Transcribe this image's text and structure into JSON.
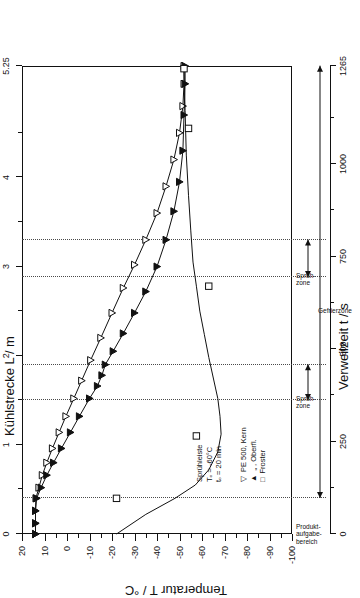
{
  "chart_data": {
    "type": "line",
    "title": "",
    "xlabel": "Temperatur T / °C",
    "ylabel": "Kühlstrecke L / m",
    "y2label": "Verweilzeit t / s",
    "xlim": [
      20,
      -100
    ],
    "ylim": [
      0,
      5.25
    ],
    "y2lim": [
      0,
      1265
    ],
    "grid": false,
    "legend_position": "inside-lower-left",
    "xticks": [
      20,
      10,
      0,
      -10,
      -20,
      -30,
      -40,
      -50,
      -60,
      -70,
      -80,
      -90,
      -100
    ],
    "xtick_labels": [
      "20",
      "10",
      "0",
      "-10",
      "-20",
      "-30",
      "-40",
      "-50",
      "-60",
      "-70",
      "-80",
      "-90",
      "-100"
    ],
    "yticks": [
      0,
      1,
      2,
      3,
      4,
      5.25
    ],
    "ytick_labels": [
      "0",
      "1",
      "2",
      "3",
      "4",
      "5.25"
    ],
    "y2ticks": [
      0,
      250,
      500,
      750,
      1000,
      1265
    ],
    "y2tick_labels": [
      "0",
      "250",
      "500",
      "750",
      "1000",
      "1265"
    ],
    "series": [
      {
        "name": "PE 500, Kern",
        "marker": "triangle-down-open",
        "points": [
          [
            14.0,
            0.0
          ],
          [
            14.0,
            0.12
          ],
          [
            14.0,
            0.26
          ],
          [
            13.8,
            0.4
          ],
          [
            12.5,
            0.52
          ],
          [
            11.0,
            0.66
          ],
          [
            9.0,
            0.8
          ],
          [
            6.5,
            0.96
          ],
          [
            3.5,
            1.14
          ],
          [
            0.5,
            1.32
          ],
          [
            -3.0,
            1.52
          ],
          [
            -6.5,
            1.72
          ],
          [
            -10.5,
            1.95
          ],
          [
            -15.0,
            2.2
          ],
          [
            -20.0,
            2.48
          ],
          [
            -25.0,
            2.76
          ],
          [
            -30.0,
            3.02
          ],
          [
            -35.0,
            3.3
          ],
          [
            -40.0,
            3.6
          ],
          [
            -44.0,
            3.9
          ],
          [
            -47.5,
            4.2
          ],
          [
            -50.0,
            4.5
          ],
          [
            -51.5,
            4.8
          ],
          [
            -52.0,
            5.05
          ],
          [
            -52.0,
            5.25
          ]
        ]
      },
      {
        "name": ",  Oberfl.",
        "marker": "triangle-down-filled",
        "points": [
          [
            14.0,
            0.0
          ],
          [
            14.0,
            0.12
          ],
          [
            14.0,
            0.26
          ],
          [
            13.5,
            0.4
          ],
          [
            11.5,
            0.52
          ],
          [
            9.0,
            0.66
          ],
          [
            6.0,
            0.8
          ],
          [
            2.5,
            0.96
          ],
          [
            -1.5,
            1.14
          ],
          [
            -5.5,
            1.32
          ],
          [
            -10.0,
            1.52
          ],
          [
            -13.5,
            1.66
          ],
          [
            -15.5,
            1.78
          ],
          [
            -17.0,
            1.9
          ],
          [
            -20.5,
            2.05
          ],
          [
            -25.0,
            2.25
          ],
          [
            -30.0,
            2.48
          ],
          [
            -35.0,
            2.72
          ],
          [
            -40.0,
            3.0
          ],
          [
            -44.0,
            3.3
          ],
          [
            -47.5,
            3.62
          ],
          [
            -50.0,
            3.95
          ],
          [
            -51.5,
            4.3
          ],
          [
            -52.0,
            4.7
          ],
          [
            -52.5,
            5.05
          ],
          [
            -52.5,
            5.25
          ]
        ]
      },
      {
        "name": "Froster",
        "marker": "square-open",
        "points": [
          [
            -22.0,
            0.0
          ],
          [
            -35.0,
            0.22
          ],
          [
            -48.0,
            0.4
          ],
          [
            -57.0,
            0.55
          ],
          [
            -63.0,
            0.72
          ],
          [
            -67.0,
            0.92
          ],
          [
            -68.5,
            1.12
          ],
          [
            -68.0,
            1.32
          ],
          [
            -67.0,
            1.52
          ],
          [
            -65.0,
            1.75
          ],
          [
            -63.0,
            1.98
          ],
          [
            -61.0,
            2.24
          ],
          [
            -59.0,
            2.5
          ],
          [
            -57.5,
            2.78
          ],
          [
            -56.0,
            3.05
          ],
          [
            -55.0,
            3.4
          ],
          [
            -54.0,
            3.8
          ],
          [
            -53.0,
            4.25
          ],
          [
            -52.5,
            4.75
          ],
          [
            -52.0,
            5.2
          ]
        ],
        "visible_markers": [
          [
            -22.0,
            0.4
          ],
          [
            -57.5,
            1.1
          ],
          [
            -63.0,
            2.78
          ],
          [
            -54.0,
            4.55
          ],
          [
            -52.0,
            5.22
          ]
        ]
      }
    ],
    "zones": [
      {
        "label": "Produkt-\naufgabe-\nbereich",
        "type": "marker-line",
        "y": 0.4
      },
      {
        "label": "Sprüh-\nzone",
        "type": "band",
        "y_from": 1.5,
        "y_to": 1.9
      },
      {
        "label": "Sprüh-\nzone",
        "type": "band",
        "y_from": 2.88,
        "y_to": 3.3
      },
      {
        "label": "Gefrierzone",
        "type": "span",
        "y_from": 0.4,
        "y_to": 5.25
      }
    ],
    "annotations": [
      "Sprühleiste",
      "Tₕ = -60°C",
      "tₕ = 20 min"
    ]
  },
  "axes": {
    "y_title": "Kühlstrecke L / m",
    "x_title": "Temperatur T / °C",
    "y2_title": "Verweilzeit t / s"
  },
  "legend": {
    "line1_marker": "▽",
    "line1_text": "PE 500, Kern",
    "line2_marker": "▲",
    "line2_text": "„  , Oberfl.",
    "line3_marker": "□",
    "line3_text": "Froster"
  },
  "conditions": {
    "line1": "Sprühleiste",
    "line2": "Tₒ = -60°C",
    "line3": "tₒ = 20 min"
  },
  "zone_labels": {
    "spray_upper_a": "Sprüh-",
    "spray_upper_b": "zone",
    "spray_lower_a": "Sprüh-",
    "spray_lower_b": "zone",
    "freeze": "Gefrierzone",
    "product_a": "Produkt-",
    "product_b": "aufgabe-",
    "product_c": "bereich"
  },
  "colors": {
    "axis": "#111111",
    "curve": "#111111",
    "dashed": "#4a4a4a",
    "background": "#ffffff"
  }
}
